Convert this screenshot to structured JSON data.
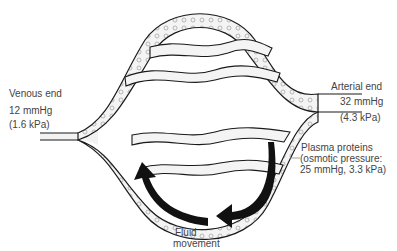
{
  "diagram": {
    "labels": {
      "venous_end": {
        "name": "Venous end",
        "pressure_mmhg": "12 mmHg",
        "pressure_kpa": "(1.6 kPa)"
      },
      "arterial_end": {
        "name": "Arterial end",
        "pressure_mmhg": "32 mmHg",
        "pressure_kpa": "(4.3 kPa)"
      },
      "plasma_proteins": {
        "line1": "Plasma proteins",
        "line2": "(osmotic pressure:",
        "line3": "25 mmHg, 3.3 kPa)"
      },
      "fluid_movement": {
        "line1": "Fluid",
        "line2": "movement"
      }
    },
    "colors": {
      "vessel_outline": "#1a1a1a",
      "vessel_fill": "#f2f2f2",
      "arrow": "#111111",
      "text": "#444444"
    }
  }
}
